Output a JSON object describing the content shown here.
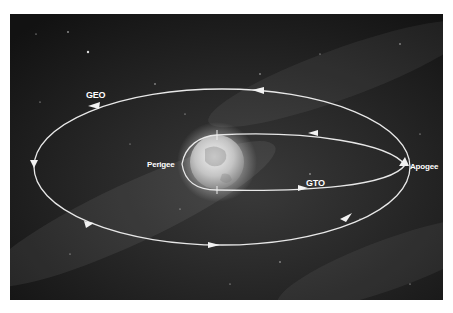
{
  "diagram": {
    "type": "orbit-diagram",
    "labels": {
      "geo": "GEO",
      "gto": "GTO",
      "perigee": "Perigee",
      "apogee": "Apogee"
    },
    "colors": {
      "background": "#1a1a1a",
      "orbit_line": "#e8e8e8",
      "label": "#ffffff",
      "earth": "#cfcfcf"
    },
    "orbits": [
      {
        "name": "GEO",
        "shape": "ellipse",
        "direction": "counter-clockwise"
      },
      {
        "name": "GTO",
        "shape": "ellipse",
        "from": "Perigee",
        "to": "Apogee"
      }
    ],
    "central_body": "Earth"
  }
}
